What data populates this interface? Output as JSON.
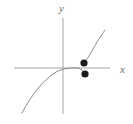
{
  "figure": {
    "type": "math-graph",
    "width": 133,
    "height": 124,
    "background_color": "#ffffff",
    "axis_color": "#9a9a9a",
    "curve_color": "#8c8c8c",
    "point_color": "#1a1a1a",
    "labels": {
      "x_axis": "x",
      "y_axis": "y"
    }
  },
  "chart_data": {
    "type": "line",
    "title": "",
    "xlabel": "x",
    "ylabel": "y",
    "grid": false,
    "legend": null,
    "axes": {
      "x_axis_y_pixel": 68,
      "y_axis_x_pixel": 63,
      "x_axis_start_pixel": 14,
      "x_axis_end_pixel": 110,
      "y_axis_start_pixel": 18,
      "y_axis_end_pixel": 114,
      "origin_pixel": [
        63,
        68
      ]
    },
    "series": [
      {
        "name": "left-branch",
        "description": "increasing curve rising steeply from lower left, flattening to a plateau through the origin and ending at the lower filled point",
        "path_points_pixels": [
          [
            22,
            113
          ],
          [
            27,
            104
          ],
          [
            33,
            95
          ],
          [
            40,
            86
          ],
          [
            48,
            78
          ],
          [
            56,
            72
          ],
          [
            64,
            69
          ],
          [
            72,
            68
          ],
          [
            78,
            68
          ],
          [
            82,
            70
          ],
          [
            85,
            74
          ]
        ]
      },
      {
        "name": "right-branch",
        "description": "curve resuming at the upper filled point and rising steeply to the upper right",
        "path_points_pixels": [
          [
            84,
            63
          ],
          [
            89,
            56
          ],
          [
            93,
            49
          ],
          [
            97,
            42
          ],
          [
            101,
            36
          ],
          [
            105,
            30
          ]
        ]
      }
    ],
    "points": [
      {
        "label": "upper-endpoint",
        "style": "filled-circle",
        "pixel": [
          84,
          63
        ],
        "radius_pixels": 3.6
      },
      {
        "label": "lower-endpoint",
        "style": "filled-circle",
        "pixel": [
          85,
          74
        ],
        "radius_pixels": 3.6
      }
    ],
    "annotations": [
      {
        "text": "x",
        "pixel": [
          116,
          70
        ],
        "style": "italic-axis-label"
      },
      {
        "text": "y",
        "pixel": [
          63,
          9
        ],
        "style": "italic-axis-label"
      }
    ]
  }
}
